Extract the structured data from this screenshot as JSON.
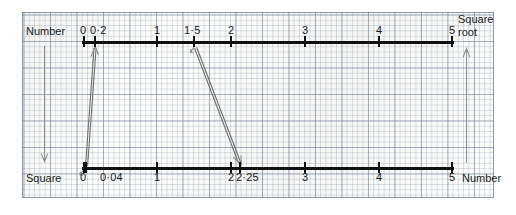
{
  "figure": {
    "type": "double-number-line-mapping",
    "top_axis": {
      "name": "Number",
      "right_caption_line1": "Square",
      "right_caption_line2": "root",
      "range": [
        0,
        5
      ],
      "tick_values": [
        0,
        0.2,
        1,
        1.5,
        2,
        3,
        4,
        5
      ],
      "tick_labels": [
        "0",
        "0·2",
        "1",
        "1·5",
        "2",
        "3",
        "4",
        "5"
      ]
    },
    "bottom_axis": {
      "name": "Square",
      "right_caption": "Number",
      "range": [
        0,
        5
      ],
      "tick_values": [
        0,
        0.04,
        1,
        2,
        2.25,
        3,
        4,
        5
      ],
      "tick_labels": [
        "0",
        "0·04",
        "1",
        "2",
        "2·25",
        "3",
        "4",
        "5"
      ]
    },
    "mappings": [
      {
        "from_axis": "bottom",
        "from_label": "0·04",
        "to_axis": "top",
        "to_label": "0·2",
        "direction": "up"
      },
      {
        "from_axis": "top",
        "from_label": "1·5",
        "to_axis": "bottom",
        "to_label": "2·25",
        "direction": "down"
      }
    ],
    "side_arrows": [
      {
        "side": "left",
        "direction": "down",
        "meaning": "Number to Square"
      },
      {
        "side": "right",
        "direction": "up",
        "meaning": "Square to Number (square root)"
      }
    ],
    "colors": {
      "axis": "#111111",
      "pencil": "#8d8d8d",
      "grid_major": "#78829688",
      "grid_minor": "#8c9baf55",
      "paper": "#fdfdfb"
    }
  },
  "chart_data": {
    "type": "line",
    "title": "",
    "xlabel": "Number",
    "ylabel": "Square",
    "x": [
      0.2,
      1.5
    ],
    "values": [
      0.04,
      2.25
    ],
    "categories": [
      "0·2 → 0·04",
      "1·5 → 2·25"
    ],
    "xlim": [
      0,
      5
    ],
    "ylim": [
      0,
      5
    ],
    "grid": true,
    "legend": "none"
  },
  "ticks_top": [
    {
      "label": "0",
      "x": 84,
      "label_x": 80,
      "show_label": true
    },
    {
      "label": "0·2",
      "x": 95,
      "label_x": 90,
      "show_label": true
    },
    {
      "label": "1",
      "x": 157,
      "label_x": 154,
      "show_label": true
    },
    {
      "label": "1·5",
      "x": 194,
      "label_x": 184,
      "show_label": true
    },
    {
      "label": "2",
      "x": 231,
      "label_x": 228,
      "show_label": true
    },
    {
      "label": "3",
      "x": 305,
      "label_x": 302,
      "show_label": true
    },
    {
      "label": "4",
      "x": 379,
      "label_x": 376,
      "show_label": true
    },
    {
      "label": "5",
      "x": 452,
      "label_x": 449,
      "show_label": true
    }
  ],
  "ticks_bottom": [
    {
      "label": "0",
      "x": 84,
      "label_x": 80,
      "show_label": true
    },
    {
      "label": "0·04",
      "x": 86,
      "label_x": 100,
      "show_label": true
    },
    {
      "label": "1",
      "x": 157,
      "label_x": 154,
      "show_label": true
    },
    {
      "label": "2",
      "x": 231,
      "label_x": 228,
      "show_label": true
    },
    {
      "label": "2·25",
      "x": 240,
      "label_x": 236,
      "show_label": true
    },
    {
      "label": "3",
      "x": 305,
      "label_x": 302,
      "show_label": true
    },
    {
      "label": "4",
      "x": 379,
      "label_x": 376,
      "show_label": true
    },
    {
      "label": "5",
      "x": 452,
      "label_x": 449,
      "show_label": true
    }
  ]
}
